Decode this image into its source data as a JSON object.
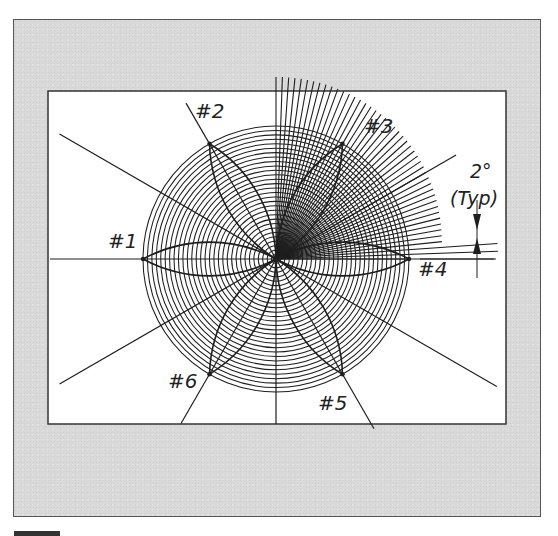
{
  "figure": {
    "type": "geometric construction drawing",
    "background_color": "#ffffff",
    "panel_color": "#d9d9d9",
    "ink_color": "#1e1e1e"
  },
  "construction": {
    "concentric_circle_count": 30,
    "petal_points": [
      {
        "label": "#1",
        "angle_deg": 180
      },
      {
        "label": "#2",
        "angle_deg": 120
      },
      {
        "label": "#3",
        "angle_deg": 60
      },
      {
        "label": "#4",
        "angle_deg": 0
      },
      {
        "label": "#5",
        "angle_deg": 300
      },
      {
        "label": "#6",
        "angle_deg": 240
      }
    ],
    "guide_line_angles_deg": [
      30,
      150,
      210,
      330,
      270
    ],
    "radial_fan": {
      "start_deg": 0,
      "end_deg": 90,
      "step_deg": 2
    }
  },
  "annotation": {
    "angle_text": "2°",
    "typ_text": "(Typ)"
  }
}
